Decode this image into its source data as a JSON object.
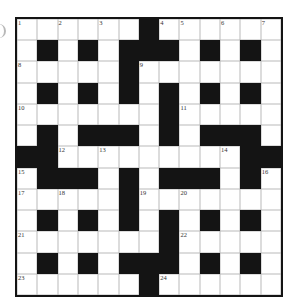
{
  "puzzle": {
    "type": "crossword",
    "rows": 13,
    "cols": 13,
    "grid": [
      "......#......",
      ".#.#.###.#.#.",
      ".....#.......",
      ".#.#.#.#.#.#.",
      ".......#.....",
      ".#.###.#.###.",
      "##.........##",
      ".###.#.###.#.",
      ".....#.......",
      ".#.#.#.#.#.#.",
      ".......#.....",
      ".#.#.###.#.#.",
      "......#......"
    ],
    "numbers": [
      {
        "n": "1",
        "r": 0,
        "c": 0
      },
      {
        "n": "2",
        "r": 0,
        "c": 2
      },
      {
        "n": "3",
        "r": 0,
        "c": 4
      },
      {
        "n": "4",
        "r": 0,
        "c": 7
      },
      {
        "n": "5",
        "r": 0,
        "c": 8
      },
      {
        "n": "6",
        "r": 0,
        "c": 10
      },
      {
        "n": "7",
        "r": 0,
        "c": 12
      },
      {
        "n": "8",
        "r": 2,
        "c": 0
      },
      {
        "n": "9",
        "r": 2,
        "c": 6
      },
      {
        "n": "10",
        "r": 4,
        "c": 0
      },
      {
        "n": "11",
        "r": 4,
        "c": 8
      },
      {
        "n": "12",
        "r": 6,
        "c": 2
      },
      {
        "n": "13",
        "r": 6,
        "c": 4
      },
      {
        "n": "14",
        "r": 6,
        "c": 10
      },
      {
        "n": "15",
        "r": 7,
        "c": 0
      },
      {
        "n": "16",
        "r": 7,
        "c": 12
      },
      {
        "n": "17",
        "r": 8,
        "c": 0
      },
      {
        "n": "18",
        "r": 8,
        "c": 2
      },
      {
        "n": "19",
        "r": 8,
        "c": 6
      },
      {
        "n": "20",
        "r": 8,
        "c": 8
      },
      {
        "n": "21",
        "r": 10,
        "c": 0
      },
      {
        "n": "22",
        "r": 10,
        "c": 8
      },
      {
        "n": "23",
        "r": 12,
        "c": 0
      },
      {
        "n": "24",
        "r": 12,
        "c": 7
      }
    ],
    "colors": {
      "block": "#141414",
      "cell": "#ffffff",
      "gridline": "#b9b9b9",
      "border": "#141414"
    }
  }
}
